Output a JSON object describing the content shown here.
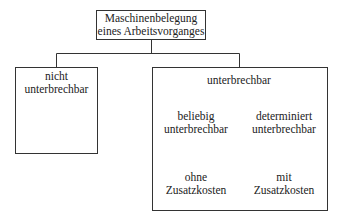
{
  "diagram": {
    "root": {
      "line1": "Maschinenbelegung",
      "line2": "eines Arbeitsvorganges"
    },
    "left_branch": {
      "line1": "nicht",
      "line2": "unterbrechbar"
    },
    "right_branch": {
      "top": "unterbrechbar",
      "mid_left": {
        "line1": "beliebig",
        "line2": "unterbrechbar"
      },
      "mid_right": {
        "line1": "determiniert",
        "line2": "unterbrechbar"
      },
      "bottom_left": {
        "line1": "ohne",
        "line2": "Zusatzkosten"
      },
      "bottom_right": {
        "line1": "mit",
        "line2": "Zusatzkosten"
      }
    },
    "edges": [
      [
        "Maschinenbelegung eines Arbeitsvorganges",
        "nicht unterbrechbar"
      ],
      [
        "Maschinenbelegung eines Arbeitsvorganges",
        "unterbrechbar"
      ],
      [
        "unterbrechbar",
        "beliebig unterbrechbar"
      ],
      [
        "unterbrechbar",
        "determiniert unterbrechbar"
      ],
      [
        "beliebig unterbrechbar",
        "ohne Zusatzkosten"
      ],
      [
        "beliebig unterbrechbar",
        "mit Zusatzkosten"
      ],
      [
        "determiniert unterbrechbar",
        "ohne Zusatzkosten"
      ],
      [
        "determiniert unterbrechbar",
        "mit Zusatzkosten"
      ]
    ],
    "colors": {
      "line": "#333333",
      "text": "#222222",
      "background": "#ffffff"
    }
  }
}
